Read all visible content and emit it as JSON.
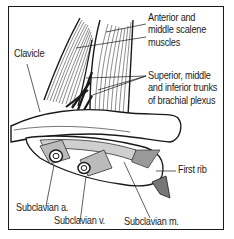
{
  "figure": {
    "type": "anatomical illustration"
  },
  "labels": {
    "scalene": {
      "line1": "Anterior and",
      "line2": "middle scalene",
      "line3": "muscles"
    },
    "clavicle": "Clavicle",
    "plexus": {
      "line1": "Superior, middle",
      "line2": "and inferior trunks",
      "line3": "of brachial plexus"
    },
    "first_rib": "First rib",
    "subclavian_artery": "Subclavian a.",
    "subclavian_vein": "Subclavian v.",
    "subclavian_muscle": "Subclavian m."
  },
  "colors": {
    "ink": "#1a1a1a",
    "paper": "#ffffff"
  }
}
